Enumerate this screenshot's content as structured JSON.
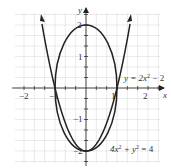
{
  "chart_data": {
    "type": "line",
    "title": "",
    "xlabel": "x",
    "ylabel": "y",
    "xlim": [
      -2.3,
      2.4
    ],
    "ylim": [
      -2.4,
      2.4
    ],
    "grid": true,
    "x_ticks": [
      -2,
      -1,
      1,
      2
    ],
    "y_ticks": [
      -2,
      -1,
      1,
      2
    ],
    "x_tick_labels": [
      "−2",
      "−1",
      "1",
      "2"
    ],
    "y_tick_labels": [
      "−2",
      "−1",
      "1",
      "2"
    ],
    "series": [
      {
        "name": "y = 2x² − 2",
        "kind": "parabola",
        "equation": "y = 2x^2 - 2",
        "x": [
          -1.4,
          -1.2,
          -1,
          -0.5,
          0,
          0.5,
          1,
          1.2,
          1.4
        ],
        "values": [
          1.92,
          0.88,
          0,
          -1.5,
          -2,
          -1.5,
          0,
          0.88,
          1.92
        ]
      },
      {
        "name": "4x² + y² = 4",
        "kind": "ellipse",
        "equation": "4x^2 + y^2 = 4",
        "semi_axis_x": 1,
        "semi_axis_y": 2
      }
    ],
    "annotations": [
      {
        "text": "y = 2x² − 2",
        "near": [
          1.2,
          0.5
        ]
      },
      {
        "text": "4x² + y² = 4",
        "near": [
          1.4,
          -1.9
        ]
      }
    ],
    "intersections": [
      [
        -1,
        0
      ],
      [
        1,
        0
      ],
      [
        0,
        -2
      ]
    ]
  },
  "labels": {
    "x_axis": "x",
    "y_axis": "y",
    "x_ticks": [
      "−2",
      "−1",
      "1",
      "2"
    ],
    "y_ticks": [
      "2",
      "1",
      "−1",
      "−2"
    ],
    "parabola_label": "y = 2x",
    "parabola_exp": "2",
    "parabola_tail": " − 2",
    "ellipse_label_a": "4x",
    "ellipse_exp1": "2",
    "ellipse_label_b": " + y",
    "ellipse_exp2": "2",
    "ellipse_label_c": " = 4"
  }
}
